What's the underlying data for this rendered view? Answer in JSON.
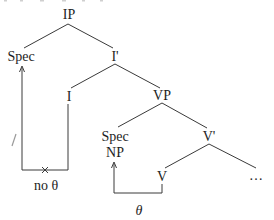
{
  "diagram": {
    "type": "syntax-tree",
    "nodes": {
      "ip": "IP",
      "spec_ip": "Spec",
      "i_bar": "I'",
      "i": "I",
      "vp": "VP",
      "spec_vp": "Spec",
      "spec_vp_np": "NP",
      "v_bar": "V'",
      "v": "V",
      "v_complement": "…"
    },
    "edges": [
      [
        "IP",
        "Spec"
      ],
      [
        "IP",
        "I'"
      ],
      [
        "I'",
        "I"
      ],
      [
        "I'",
        "VP"
      ],
      [
        "VP",
        "Spec"
      ],
      [
        "VP",
        "V'"
      ],
      [
        "V'",
        "V"
      ],
      [
        "V'",
        "…"
      ]
    ],
    "arrows": [
      {
        "from": "I",
        "to": "Spec (IP)",
        "label": "no θ",
        "blocked": true,
        "blocked_mark": "×"
      },
      {
        "from": "V",
        "to": "Spec NP (VP)",
        "label": "θ",
        "blocked": false
      }
    ],
    "labels": {
      "no_theta": "no θ",
      "theta": "θ",
      "blocked_mark": "×"
    }
  }
}
